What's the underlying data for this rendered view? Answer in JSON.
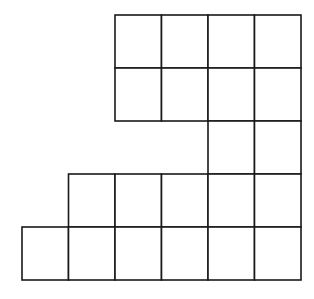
{
  "diagram": {
    "type": "square-grid-polyomino",
    "rows": 5,
    "cols": 6,
    "cell_size": 46.5,
    "origin": {
      "x": 22,
      "y": 15
    },
    "line_color": "#1a1a1a",
    "fill_color": "#ffffff",
    "filled_cells": [
      {
        "row": 0,
        "cols": [
          2,
          3,
          4,
          5
        ]
      },
      {
        "row": 1,
        "cols": [
          2,
          3,
          4,
          5
        ]
      },
      {
        "row": 2,
        "cols": [
          4,
          5
        ]
      },
      {
        "row": 3,
        "cols": [
          1,
          2,
          3,
          4,
          5
        ]
      },
      {
        "row": 4,
        "cols": [
          0,
          1,
          2,
          3,
          4,
          5
        ]
      }
    ],
    "total_squares": 21
  }
}
